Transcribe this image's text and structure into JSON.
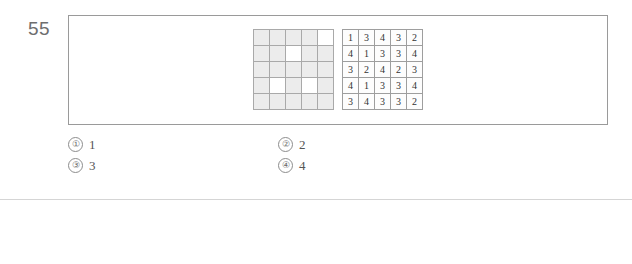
{
  "question": {
    "number": "55",
    "pattern_grid": {
      "rows": 5,
      "cols": 5,
      "blank_cells": [
        [
          0,
          4
        ],
        [
          1,
          2
        ],
        [
          3,
          1
        ],
        [
          3,
          3
        ]
      ]
    },
    "number_grid": {
      "rows": 5,
      "cols": 5,
      "values": [
        [
          "1",
          "3",
          "4",
          "3",
          "2"
        ],
        [
          "4",
          "1",
          "3",
          "3",
          "4"
        ],
        [
          "3",
          "2",
          "4",
          "2",
          "3"
        ],
        [
          "4",
          "1",
          "3",
          "3",
          "4"
        ],
        [
          "3",
          "4",
          "3",
          "3",
          "2"
        ]
      ]
    }
  },
  "choices": [
    {
      "marker": "①",
      "text": "1"
    },
    {
      "marker": "②",
      "text": "2"
    },
    {
      "marker": "③",
      "text": "3"
    },
    {
      "marker": "④",
      "text": "4"
    }
  ],
  "solution": {
    "badge": {
      "check_glyph": "✔",
      "label": "해설"
    },
    "grids": [
      {
        "rows": 5,
        "cols": 5,
        "values": [
          [
            "",
            "",
            "",
            "",
            "2"
          ],
          [
            "",
            "",
            "3",
            "",
            ""
          ],
          [
            "",
            "",
            "",
            "",
            ""
          ],
          [
            "",
            "1",
            "",
            "3",
            ""
          ],
          [
            "",
            "",
            "",
            "",
            ""
          ]
        ]
      },
      {
        "rows": 5,
        "cols": 5,
        "values": [
          [
            "1",
            "",
            "",
            "",
            ""
          ],
          [
            "",
            "",
            "",
            "3",
            ""
          ],
          [
            "",
            "2",
            "",
            "",
            ""
          ],
          [
            "",
            "",
            "",
            "3",
            ""
          ],
          [
            "",
            "",
            "",
            "",
            ""
          ]
        ]
      },
      {
        "rows": 5,
        "cols": 5,
        "values": [
          [
            "",
            "",
            "",
            "",
            ""
          ],
          [
            "",
            "1",
            "",
            "3",
            ""
          ],
          [
            "",
            "",
            "",
            "",
            ""
          ],
          [
            "",
            "",
            "3",
            "",
            ""
          ],
          [
            "3",
            "",
            "",
            "",
            ""
          ]
        ]
      },
      {
        "rows": 5,
        "cols": 5,
        "values": [
          [
            "",
            "",
            "",
            "",
            ""
          ],
          [
            "",
            "1",
            "",
            "",
            ""
          ],
          [
            "",
            "",
            "",
            "2",
            ""
          ],
          [
            "",
            "1",
            "",
            "",
            ""
          ],
          [
            "",
            "",
            "",
            "",
            "2"
          ]
        ]
      }
    ]
  }
}
